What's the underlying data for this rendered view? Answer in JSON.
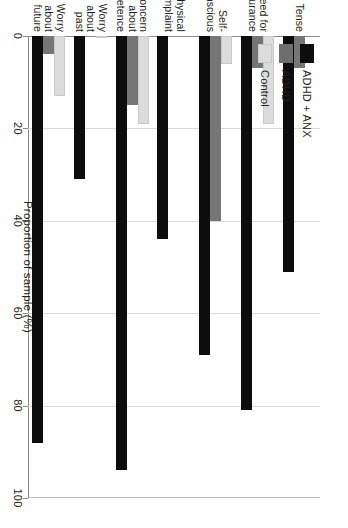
{
  "chart_data": {
    "type": "bar",
    "orientation": "horizontal",
    "title": "",
    "xlabel": "",
    "ylabel": "Proportion of sample (%)",
    "value_axis_title": "Proportion of sample (%)",
    "ylim": [
      0,
      100
    ],
    "value_ticks": [
      0,
      20,
      40,
      60,
      80,
      100
    ],
    "tick_labels": [
      "0",
      "20",
      "40",
      "60",
      "80",
      "100"
    ],
    "grid": true,
    "legend_position": "top-left",
    "categories": [
      "Worry about future",
      "Worry about past",
      "Concern about competence",
      "Physical complaint",
      "Self-conscious",
      "Need for reassurance",
      "Tense"
    ],
    "category_labels": [
      "Worry\nabout\nfuture",
      "Worry\nabout\npast",
      "Concern\nabout\ncompetence",
      "Physical\ncomplaint",
      "Self-\nconscious",
      "Need for\nreassurance",
      "Tense"
    ],
    "series": [
      {
        "name": "ADHD + ANX",
        "color": "#0d0d0d",
        "values": [
          88,
          31,
          94,
          44,
          69,
          81,
          51
        ]
      },
      {
        "name": "ADHD",
        "color": "#6e6e6e",
        "values": [
          4,
          0,
          15,
          0,
          40,
          7,
          7
        ]
      },
      {
        "name": "Control",
        "color": "#dcdcdc",
        "values": [
          13,
          0.5,
          19,
          0,
          6,
          19,
          0
        ]
      }
    ]
  },
  "legend": {
    "items": [
      {
        "label": "ADHD + ANX",
        "color": "#0d0d0d"
      },
      {
        "label": "ADHD",
        "color": "#6e6e6e"
      },
      {
        "label": "Control",
        "color": "#dcdcdc"
      }
    ]
  },
  "colors": {
    "adhd_anx": "#0d0d0d",
    "adhd": "#6e6e6e",
    "control": "#dcdcdc",
    "axis": "#8c8c8c",
    "grid": "#d9d9d9",
    "text": "#231f20",
    "background": "#ffffff"
  }
}
